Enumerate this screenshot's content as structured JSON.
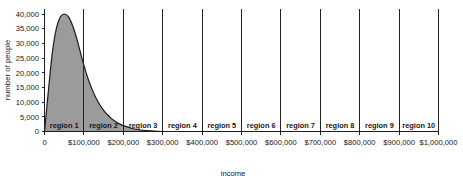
{
  "chart_data": {
    "type": "area",
    "title": "",
    "xlabel": "income",
    "ylabel": "number of people",
    "xlim": [
      0,
      1000000
    ],
    "ylim": [
      0,
      40000
    ],
    "grid": false,
    "legend": "none",
    "x_tick_labels": [
      "0",
      "$100,000",
      "$200,000",
      "$300,000",
      "$400,000",
      "$500,000",
      "$600,000",
      "$700,000",
      "$800,000",
      "$900,000",
      "$1,000,000"
    ],
    "x_tick_values": [
      0,
      100000,
      200000,
      300000,
      400000,
      500000,
      600000,
      700000,
      800000,
      900000,
      1000000
    ],
    "y_tick_labels": [
      "0",
      "5,000",
      "10,000",
      "15,000",
      "20,000",
      "25,000",
      "30,000",
      "35,000",
      "40,000"
    ],
    "y_tick_values": [
      0,
      5000,
      10000,
      15000,
      20000,
      25000,
      30000,
      35000,
      40000
    ],
    "series": [
      {
        "name": "number of people",
        "fill_color": "#9b9b9b",
        "line_color": "#1c1c1c",
        "x": [
          0,
          10000,
          20000,
          30000,
          40000,
          50000,
          60000,
          70000,
          80000,
          90000,
          100000,
          110000,
          120000,
          130000,
          140000,
          150000,
          160000,
          170000,
          180000,
          190000,
          200000,
          220000,
          240000,
          260000,
          280000,
          300000
        ],
        "values": [
          0,
          14000,
          27000,
          35000,
          39000,
          40000,
          39200,
          36500,
          32500,
          27500,
          22500,
          18200,
          14600,
          11600,
          9200,
          7200,
          5700,
          4400,
          3400,
          2600,
          2000,
          1100,
          600,
          300,
          120,
          0
        ]
      }
    ],
    "regions": [
      {
        "label": "region 1",
        "start": 0,
        "end": 100000
      },
      {
        "label": "region 2",
        "start": 100000,
        "end": 200000
      },
      {
        "label": "region 3",
        "start": 200000,
        "end": 300000
      },
      {
        "label": "region 4",
        "start": 300000,
        "end": 400000
      },
      {
        "label": "region 5",
        "start": 400000,
        "end": 500000
      },
      {
        "label": "region 6",
        "start": 500000,
        "end": 600000
      },
      {
        "label": "region 7",
        "start": 600000,
        "end": 700000
      },
      {
        "label": "region 8",
        "start": 700000,
        "end": 800000
      },
      {
        "label": "region 9",
        "start": 800000,
        "end": 900000
      },
      {
        "label": "region 10",
        "start": 900000,
        "end": 1000000
      }
    ]
  }
}
